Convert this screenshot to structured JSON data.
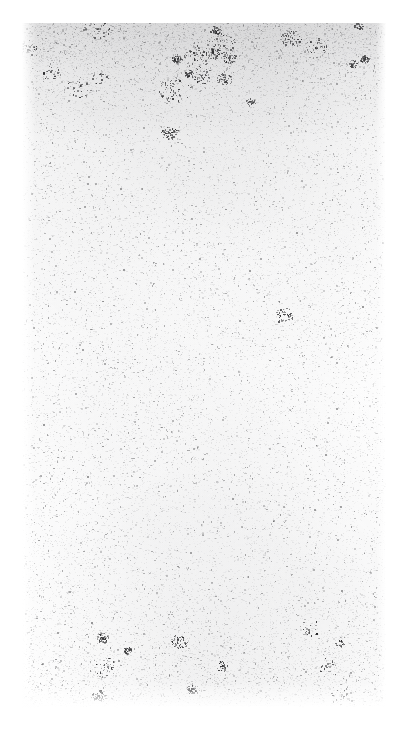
{
  "page": {
    "kind": "scanned-document-page",
    "content_description": "Blank page from a scanned document",
    "visible_text": "",
    "page_background_color": "#ffffff",
    "paper_tone_color": "#fbfbfb",
    "speckle_color": "#9a9a9c",
    "dark_speckle_color": "#2e2e30",
    "canvas_width": 408,
    "canvas_height": 729,
    "margins": {
      "left": 22,
      "top": 23,
      "right": 22,
      "bottom": 21
    },
    "paper_area": {
      "width": 364,
      "height": 685
    },
    "noise": {
      "fine_speckle_count": 26000,
      "mid_speckle_count": 5200,
      "dark_cluster_count": 34,
      "top_band_density_multiplier": 3.4,
      "bottom_band_density_multiplier": 1.8,
      "seed": 20240517
    },
    "accessible_caption": "Blank scanned page showing only paper grain and photocopy speckle; no text or figures are present."
  }
}
